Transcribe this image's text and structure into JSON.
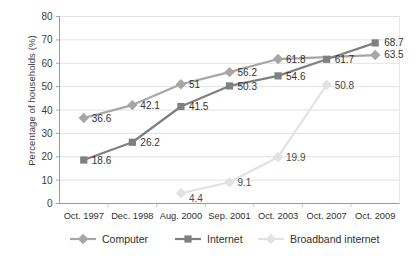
{
  "chart_data": {
    "type": "line",
    "title": "",
    "xlabel": "",
    "ylabel": "Percentage of households (%)",
    "ylim": [
      0,
      80
    ],
    "ytick_step": 10,
    "yticks": [
      "0",
      "10",
      "20",
      "30",
      "40",
      "50",
      "60",
      "70",
      "80"
    ],
    "grid": true,
    "legend_position": "bottom",
    "categories": [
      "Oct. 1997",
      "Dec. 1998",
      "Aug. 2000",
      "Sep. 2001",
      "Oct. 2003",
      "Oct. 2007",
      "Oct. 2009"
    ],
    "series": [
      {
        "name": "Computer",
        "color": "#a6a6a6",
        "marker": "diamond",
        "values": [
          36.6,
          42.1,
          51,
          56.2,
          61.8,
          null,
          63.5
        ],
        "labels": [
          "36.6",
          "42.1",
          "51",
          "56.2",
          "61.8",
          "",
          "63.5"
        ]
      },
      {
        "name": "Internet",
        "color": "#808080",
        "marker": "square",
        "values": [
          18.6,
          26.2,
          41.5,
          50.3,
          54.6,
          61.7,
          68.7
        ],
        "labels": [
          "18.6",
          "26.2",
          "41.5",
          "50.3",
          "54.6",
          "61.7",
          "68.7"
        ]
      },
      {
        "name": "Broadband internet",
        "color": "#e2e2e2",
        "marker": "diamond",
        "values": [
          null,
          null,
          4.4,
          9.1,
          19.9,
          50.8,
          null
        ],
        "labels": [
          "",
          "",
          "4.4",
          "9.1",
          "19.9",
          "50.8",
          ""
        ]
      }
    ]
  },
  "legend": {
    "items": [
      {
        "label": "Computer"
      },
      {
        "label": "Internet"
      },
      {
        "label": "Broadband internet"
      }
    ]
  }
}
